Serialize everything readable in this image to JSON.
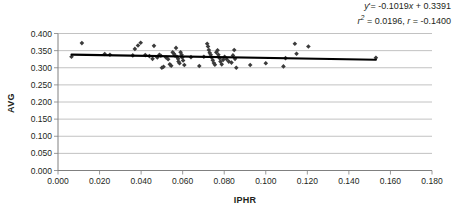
{
  "chart_data": {
    "type": "scatter",
    "title": "",
    "xlabel": "IPHR",
    "ylabel": "AVG",
    "xlim": [
      0.0,
      0.18
    ],
    "ylim": [
      0.0,
      0.4
    ],
    "xticks": [
      "0.000",
      "0.020",
      "0.040",
      "0.060",
      "0.080",
      "0.100",
      "0.120",
      "0.140",
      "0.160",
      "0.180"
    ],
    "xtick_values": [
      0.0,
      0.02,
      0.04,
      0.06,
      0.08,
      0.1,
      0.12,
      0.14,
      0.16,
      0.18
    ],
    "yticks": [
      "0.000",
      "0.050",
      "0.100",
      "0.150",
      "0.200",
      "0.250",
      "0.300",
      "0.350",
      "0.400"
    ],
    "ytick_values": [
      0.0,
      0.05,
      0.1,
      0.15,
      0.2,
      0.25,
      0.3,
      0.35,
      0.4
    ],
    "grid": "horizontal",
    "legend": "none",
    "marker": "diamond",
    "marker_color": "#3b3b3b",
    "points": [
      [
        0.0065,
        0.332
      ],
      [
        0.0115,
        0.372
      ],
      [
        0.0225,
        0.34
      ],
      [
        0.025,
        0.338
      ],
      [
        0.036,
        0.336
      ],
      [
        0.037,
        0.355
      ],
      [
        0.0385,
        0.365
      ],
      [
        0.0398,
        0.373
      ],
      [
        0.042,
        0.337
      ],
      [
        0.044,
        0.334
      ],
      [
        0.0455,
        0.326
      ],
      [
        0.0462,
        0.364
      ],
      [
        0.0478,
        0.33
      ],
      [
        0.0488,
        0.338
      ],
      [
        0.0495,
        0.335
      ],
      [
        0.05,
        0.3
      ],
      [
        0.0508,
        0.303
      ],
      [
        0.052,
        0.33
      ],
      [
        0.053,
        0.325
      ],
      [
        0.0538,
        0.31
      ],
      [
        0.0545,
        0.306
      ],
      [
        0.0552,
        0.345
      ],
      [
        0.0558,
        0.341
      ],
      [
        0.0562,
        0.336
      ],
      [
        0.0568,
        0.358
      ],
      [
        0.0572,
        0.332
      ],
      [
        0.0578,
        0.326
      ],
      [
        0.058,
        0.318
      ],
      [
        0.0585,
        0.313
      ],
      [
        0.059,
        0.345
      ],
      [
        0.0595,
        0.338
      ],
      [
        0.0598,
        0.33
      ],
      [
        0.0602,
        0.321
      ],
      [
        0.0608,
        0.308
      ],
      [
        0.064,
        0.331
      ],
      [
        0.068,
        0.305
      ],
      [
        0.0702,
        0.332
      ],
      [
        0.0718,
        0.37
      ],
      [
        0.0722,
        0.362
      ],
      [
        0.0726,
        0.352
      ],
      [
        0.073,
        0.344
      ],
      [
        0.0735,
        0.338
      ],
      [
        0.074,
        0.33
      ],
      [
        0.0745,
        0.322
      ],
      [
        0.075,
        0.314
      ],
      [
        0.0755,
        0.309
      ],
      [
        0.0762,
        0.345
      ],
      [
        0.0768,
        0.351
      ],
      [
        0.0772,
        0.338
      ],
      [
        0.0778,
        0.328
      ],
      [
        0.0782,
        0.318
      ],
      [
        0.0788,
        0.31
      ],
      [
        0.0795,
        0.323
      ],
      [
        0.0802,
        0.332
      ],
      [
        0.0812,
        0.325
      ],
      [
        0.0822,
        0.318
      ],
      [
        0.0835,
        0.315
      ],
      [
        0.0842,
        0.336
      ],
      [
        0.0848,
        0.352
      ],
      [
        0.0852,
        0.326
      ],
      [
        0.0858,
        0.3
      ],
      [
        0.0925,
        0.308
      ],
      [
        0.1,
        0.313
      ],
      [
        0.1085,
        0.304
      ],
      [
        0.1095,
        0.328
      ],
      [
        0.114,
        0.37
      ],
      [
        0.1148,
        0.341
      ],
      [
        0.1205,
        0.362
      ],
      [
        0.153,
        0.329
      ]
    ],
    "trendline": {
      "equation": "y'= -0.1019x + 0.3391",
      "slope": -0.1019,
      "intercept": 0.3391,
      "x_start": 0.0065,
      "x_end": 0.153,
      "color": "#000000"
    },
    "annotation_lines": [
      "y'= -0.1019x + 0.3391",
      "r2 = 0.0196, r = -0.1400"
    ],
    "statistics": {
      "r_squared": 0.0196,
      "r": -0.14
    }
  },
  "annotation": {
    "eq_y": "y",
    "eq_prime": "'= -0.1019",
    "eq_x": "x",
    "eq_rest": " + 0.3391",
    "stat_r": "r",
    "stat_sup": "2",
    "stat_rest": " = 0.0196, ",
    "stat_r2": "r",
    "stat_tail": " = -0.1400"
  },
  "axes": {
    "x_title": "IPHR",
    "y_title": "AVG"
  }
}
